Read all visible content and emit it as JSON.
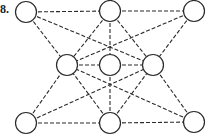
{
  "figure": {
    "label": "8.",
    "stroke_color": "#2a2a2a",
    "node_fill": "#ffffff",
    "node_radius": 10.5,
    "nodes": [
      {
        "id": "TL",
        "x": 26,
        "y": 12
      },
      {
        "id": "TM",
        "x": 110,
        "y": 11
      },
      {
        "id": "TR",
        "x": 194,
        "y": 11
      },
      {
        "id": "ML",
        "x": 67,
        "y": 65
      },
      {
        "id": "C",
        "x": 110,
        "y": 65
      },
      {
        "id": "MR",
        "x": 153,
        "y": 65
      },
      {
        "id": "BL",
        "x": 26,
        "y": 123
      },
      {
        "id": "BM",
        "x": 110,
        "y": 123
      },
      {
        "id": "BR",
        "x": 194,
        "y": 122
      }
    ],
    "edges": [
      [
        "TL",
        "TM"
      ],
      [
        "TM",
        "TR"
      ],
      [
        "BL",
        "BM"
      ],
      [
        "BM",
        "BR"
      ],
      [
        "TL",
        "ML"
      ],
      [
        "TR",
        "MR"
      ],
      [
        "BL",
        "ML"
      ],
      [
        "BR",
        "MR"
      ],
      [
        "TL",
        "MR"
      ],
      [
        "TR",
        "ML"
      ],
      [
        "BL",
        "MR"
      ],
      [
        "BR",
        "ML"
      ],
      [
        "TM",
        "ML"
      ],
      [
        "TM",
        "C"
      ],
      [
        "TM",
        "MR"
      ],
      [
        "BM",
        "ML"
      ],
      [
        "BM",
        "C"
      ],
      [
        "BM",
        "MR"
      ],
      [
        "ML",
        "C"
      ],
      [
        "C",
        "MR"
      ]
    ],
    "edge_style": "dashed"
  }
}
